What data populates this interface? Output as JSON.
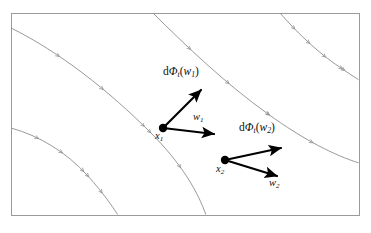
{
  "figure": {
    "kind": "mathematical-diagram",
    "width": 371,
    "height": 233,
    "background_color": "#ffffff"
  },
  "frame": {
    "name": "bounding-rectangle",
    "x": 11,
    "y": 13,
    "width": 348,
    "height": 202,
    "stroke_color": "#9a9a9a",
    "stroke_width": 1
  },
  "curves": {
    "name": "integral-curves",
    "stroke_color": "#8d8d8d",
    "stroke_width": 0.9,
    "tick_color": "#8d8d8d",
    "count": 4,
    "items": [
      {
        "id": "curve-1",
        "path": "M 11,28 C 60,52 110,92 150,132 C 182,164 198,192 206,215"
      },
      {
        "id": "curve-2",
        "path": "M 11,128 C 40,136 66,152 88,176 C 104,194 112,206 118,215"
      },
      {
        "id": "curve-3",
        "path": "M 153,13 C 186,46 226,84 268,114 C 304,140 334,155 359,163"
      },
      {
        "id": "curve-4",
        "path": "M 280,13 C 300,36 322,56 344,70 C 351,75 356,78 359,80"
      }
    ]
  },
  "points": [
    {
      "id": "x1",
      "name": "base-point-x1",
      "cx": 163,
      "cy": 128,
      "r": 4.2,
      "color": "#000000",
      "label": "x",
      "label_sub": "1"
    },
    {
      "id": "x2",
      "name": "base-point-x2",
      "cx": 225,
      "cy": 160,
      "r": 4.2,
      "color": "#000000",
      "label": "x",
      "label_sub": "2"
    }
  ],
  "vectors": [
    {
      "id": "w1",
      "name": "tangent-vector-w1",
      "from": [
        163,
        128
      ],
      "to": [
        214,
        134
      ],
      "color": "#000000",
      "stroke_width": 2.2,
      "label": "w",
      "label_sub": "1"
    },
    {
      "id": "dphi-w1",
      "name": "pushforward-vector-dphi-w1",
      "from": [
        163,
        128
      ],
      "to": [
        201,
        90
      ],
      "color": "#000000",
      "stroke_width": 2.2,
      "label_prefix": "d",
      "label_phi": "Φ",
      "label_phi_sub": "t",
      "label_arg_open": "(",
      "label_arg": "w",
      "label_arg_sub": "1",
      "label_arg_close": ")"
    },
    {
      "id": "w2",
      "name": "tangent-vector-w2",
      "from": [
        225,
        160
      ],
      "to": [
        277,
        176
      ],
      "color": "#000000",
      "stroke_width": 2.2,
      "label": "w",
      "label_sub": "2"
    },
    {
      "id": "dphi-w2",
      "name": "pushforward-vector-dphi-w2",
      "from": [
        225,
        160
      ],
      "to": [
        281,
        148
      ],
      "color": "#000000",
      "stroke_width": 2.2,
      "label_prefix": "d",
      "label_phi": "Φ",
      "label_phi_sub": "t",
      "label_arg_open": "(",
      "label_arg": "w",
      "label_arg_sub": "2",
      "label_arg_close": ")"
    }
  ],
  "labels": {
    "dphi_w1": {
      "prefix": "d",
      "phi": "Φ",
      "phi_sub": "t",
      "open": "(",
      "arg": "w",
      "arg_sub": "1",
      "close": ")"
    },
    "dphi_w2": {
      "prefix": "d",
      "phi": "Φ",
      "phi_sub": "t",
      "open": "(",
      "arg": "w",
      "arg_sub": "2",
      "close": ")"
    },
    "w1": {
      "base": "w",
      "sub": "1"
    },
    "w2": {
      "base": "w",
      "sub": "2"
    },
    "x1": {
      "base": "x",
      "sub": "1"
    },
    "x2": {
      "base": "x",
      "sub": "2"
    }
  }
}
